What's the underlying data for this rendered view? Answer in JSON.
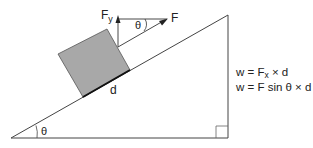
{
  "diagram": {
    "labels": {
      "force": "F",
      "force_y": "F",
      "force_y_sub": "y",
      "angle_top": "θ",
      "angle_bottom": "θ",
      "distance": "d"
    },
    "equations": {
      "line1_prefix": "w = F",
      "line1_sub": "x",
      "line1_suffix": " × d",
      "line2": "w = F sin θ × d"
    },
    "colors": {
      "line": "#333333",
      "block_fill": "#a8a8a8",
      "block_stroke": "#444444",
      "background": "#ffffff"
    }
  }
}
